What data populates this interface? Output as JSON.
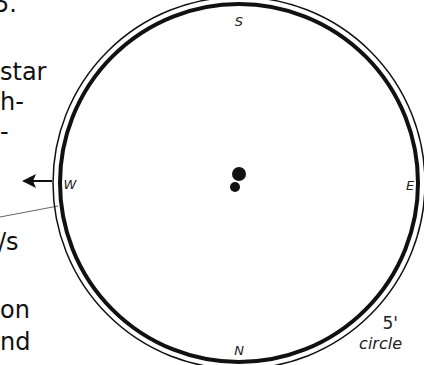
{
  "text_fragments": [
    {
      "text": "5.",
      "x": -6,
      "y": -6
    },
    {
      "text": "star",
      "x": 0,
      "y": 64
    },
    {
      "text": "h-",
      "x": 0,
      "y": 94
    },
    {
      "text": "-",
      "x": 0,
      "y": 124
    },
    {
      "text": "/s",
      "x": 0,
      "y": 234
    },
    {
      "text": "on",
      "x": 0,
      "y": 302
    },
    {
      "text": "nd",
      "x": 0,
      "y": 334
    }
  ],
  "diagram": {
    "compass": {
      "north": "N",
      "south": "S",
      "east": "E",
      "west": "W"
    },
    "circle_label_size": "5'",
    "circle_label_word": "circle",
    "center_marker": "player-token",
    "arrow_direction": "west"
  }
}
